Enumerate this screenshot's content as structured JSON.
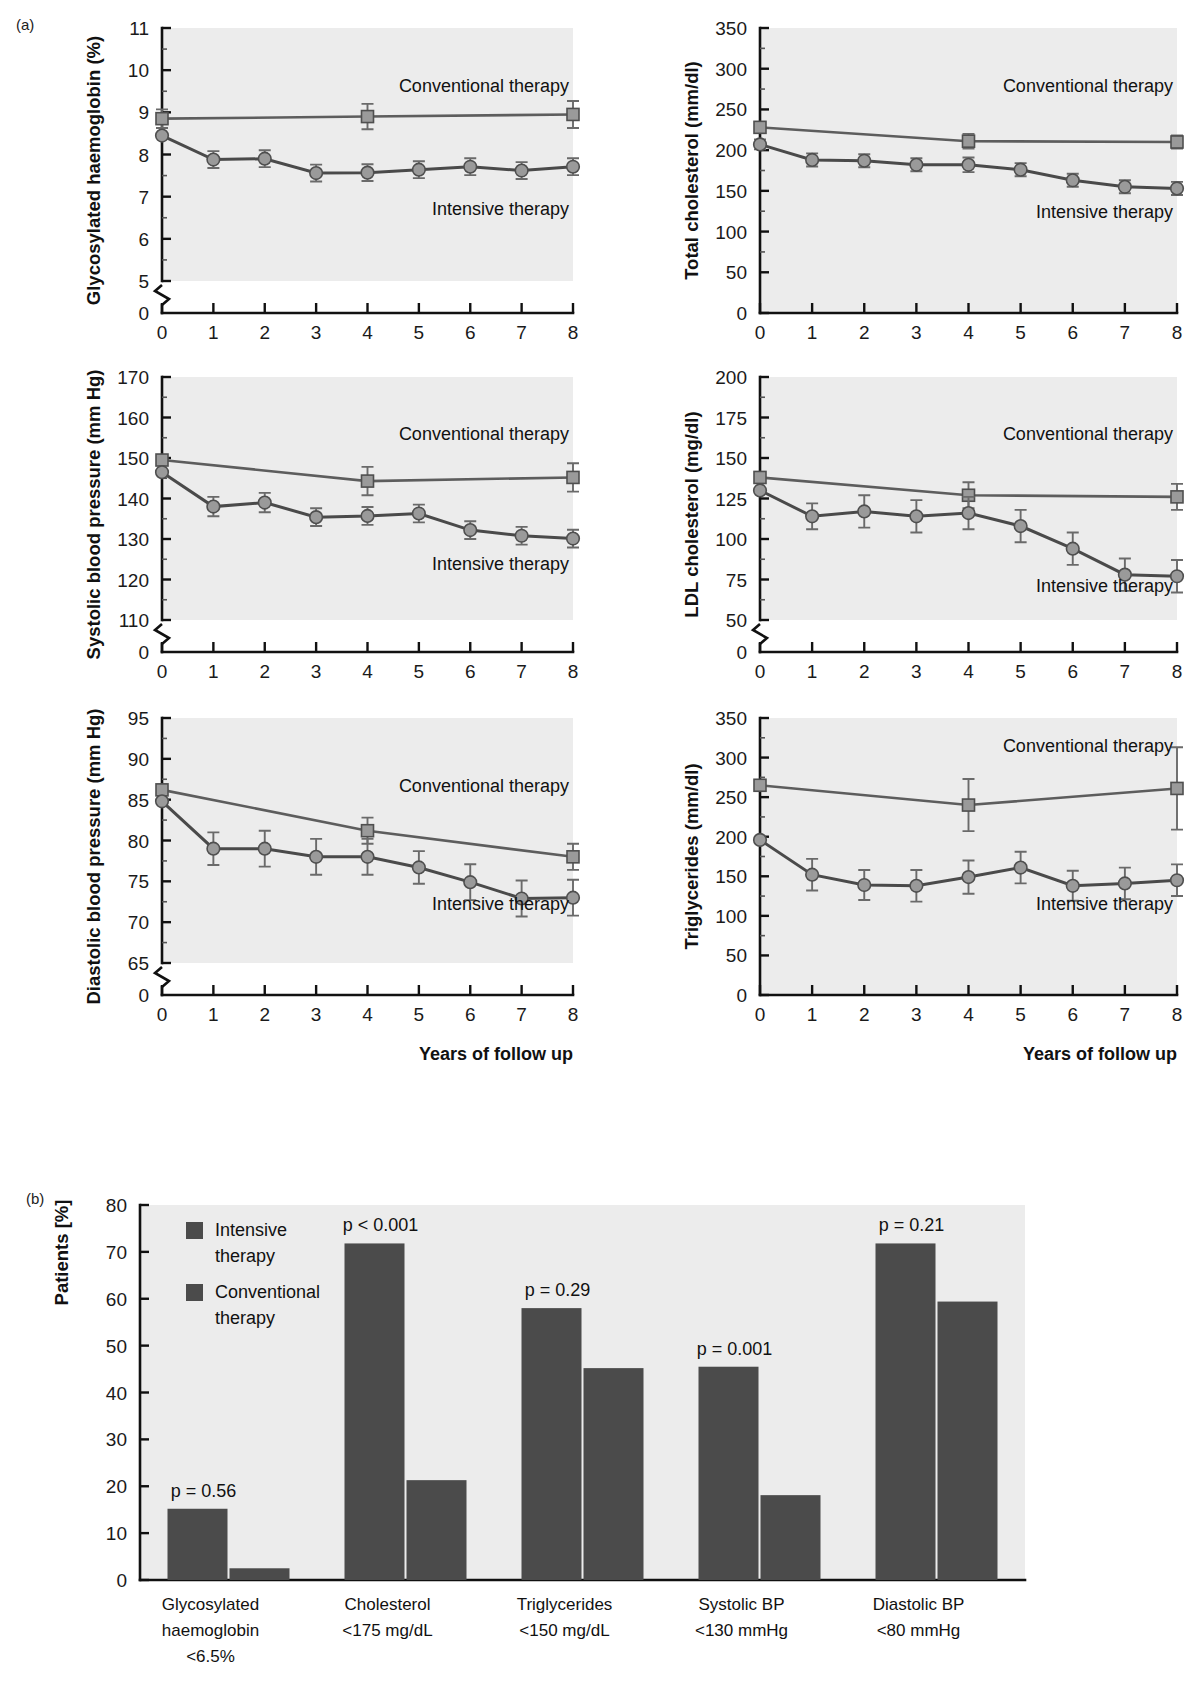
{
  "panels": {
    "a_label": "(a)",
    "b_label": "(b)"
  },
  "common": {
    "xaxis_caption": "Years of follow up",
    "series_conventional": "Conventional therapy",
    "series_intensive": "Intensive therapy",
    "x_ticks": [
      "0",
      "1",
      "2",
      "3",
      "4",
      "5",
      "6",
      "7",
      "8"
    ]
  },
  "chart_data": [
    {
      "id": "hba1c",
      "type": "line",
      "title": "",
      "ylabel": "Glycosylated haemoglobin (%)",
      "xlabel": "Years of follow up",
      "x": [
        0,
        1,
        2,
        3,
        4,
        5,
        6,
        7,
        8
      ],
      "ytick_labels": [
        "0",
        "5",
        "6",
        "7",
        "8",
        "9",
        "10",
        "11"
      ],
      "ytick_values": [
        0,
        5,
        6,
        7,
        8,
        9,
        10,
        11
      ],
      "ylim": [
        5,
        11
      ],
      "axis_break": true,
      "grid": false,
      "legend_position": "inline-right",
      "series": [
        {
          "name": "Conventional therapy",
          "marker": "square",
          "x": [
            0,
            4,
            8
          ],
          "values": [
            8.85,
            8.9,
            8.95
          ],
          "errors": [
            0.22,
            0.3,
            0.32
          ]
        },
        {
          "name": "Intensive therapy",
          "marker": "circle",
          "x": [
            0,
            1,
            2,
            3,
            4,
            5,
            6,
            7,
            8
          ],
          "values": [
            8.45,
            7.88,
            7.9,
            7.56,
            7.57,
            7.64,
            7.71,
            7.62,
            7.71
          ],
          "errors": [
            0.0,
            0.2,
            0.2,
            0.2,
            0.2,
            0.2,
            0.2,
            0.2,
            0.2
          ]
        }
      ]
    },
    {
      "id": "total-cholesterol",
      "type": "line",
      "title": "",
      "ylabel": "Total cholesterol (mm/dl)",
      "xlabel": "Years of follow up",
      "x": [
        0,
        1,
        2,
        3,
        4,
        5,
        6,
        7,
        8
      ],
      "ytick_labels": [
        "0",
        "50",
        "100",
        "150",
        "200",
        "250",
        "300",
        "350"
      ],
      "ytick_values": [
        0,
        50,
        100,
        150,
        200,
        250,
        300,
        350
      ],
      "ylim": [
        0,
        350
      ],
      "axis_break": false,
      "grid": false,
      "legend_position": "inline-right",
      "series": [
        {
          "name": "Conventional therapy",
          "marker": "square",
          "x": [
            0,
            4,
            8
          ],
          "values": [
            228,
            211,
            210
          ],
          "errors": [
            0.0,
            9,
            8
          ]
        },
        {
          "name": "Intensive therapy",
          "marker": "circle",
          "x": [
            0,
            1,
            2,
            3,
            4,
            5,
            6,
            7,
            8
          ],
          "values": [
            207,
            188,
            187,
            182,
            182,
            176,
            163,
            155,
            153
          ],
          "errors": [
            6,
            8,
            8,
            8,
            9,
            8,
            8,
            8,
            8
          ]
        }
      ]
    },
    {
      "id": "systolic-bp",
      "type": "line",
      "title": "",
      "ylabel": "Systolic blood pressure (mm Hg)",
      "xlabel": "Years of follow up",
      "x": [
        0,
        1,
        2,
        3,
        4,
        5,
        6,
        7,
        8
      ],
      "ytick_labels": [
        "0",
        "110",
        "120",
        "130",
        "140",
        "150",
        "160",
        "170"
      ],
      "ytick_values": [
        0,
        110,
        120,
        130,
        140,
        150,
        160,
        170
      ],
      "ylim": [
        110,
        170
      ],
      "axis_break": true,
      "grid": false,
      "legend_position": "inline-right",
      "series": [
        {
          "name": "Conventional therapy",
          "marker": "square",
          "x": [
            0,
            4,
            8
          ],
          "values": [
            149.5,
            144.3,
            145.2
          ],
          "errors": [
            0.0,
            3.5,
            3.5
          ]
        },
        {
          "name": "Intensive therapy",
          "marker": "circle",
          "x": [
            0,
            1,
            2,
            3,
            4,
            5,
            6,
            7,
            8
          ],
          "values": [
            146.5,
            138.0,
            139.0,
            135.4,
            135.7,
            136.3,
            132.2,
            130.8,
            130.1
          ],
          "errors": [
            0.0,
            2.4,
            2.4,
            2.2,
            2.2,
            2.2,
            2.2,
            2.2,
            2.2
          ]
        }
      ]
    },
    {
      "id": "ldl-cholesterol",
      "type": "line",
      "title": "",
      "ylabel": "LDL cholesterol (mg/dl)",
      "xlabel": "Years of follow up",
      "x": [
        0,
        1,
        2,
        3,
        4,
        5,
        6,
        7,
        8
      ],
      "ytick_labels": [
        "0",
        "50",
        "75",
        "100",
        "125",
        "150",
        "175",
        "200"
      ],
      "ytick_values": [
        0,
        50,
        75,
        100,
        125,
        150,
        175,
        200
      ],
      "ylim": [
        50,
        200
      ],
      "axis_break": true,
      "grid": false,
      "legend_position": "inline-right",
      "series": [
        {
          "name": "Conventional therapy",
          "marker": "square",
          "x": [
            0,
            4,
            8
          ],
          "values": [
            138,
            127,
            126
          ],
          "errors": [
            0.0,
            8,
            8
          ]
        },
        {
          "name": "Intensive therapy",
          "marker": "circle",
          "x": [
            0,
            1,
            2,
            3,
            4,
            5,
            6,
            7,
            8
          ],
          "values": [
            130,
            114,
            117,
            114,
            116,
            108,
            94,
            78,
            77
          ],
          "errors": [
            0.0,
            8,
            10,
            10,
            10,
            10,
            10,
            10,
            10
          ]
        }
      ]
    },
    {
      "id": "diastolic-bp",
      "type": "line",
      "title": "",
      "ylabel": "Diastolic blood pressure (mm Hg)",
      "xlabel": "Years of follow up",
      "x": [
        0,
        1,
        2,
        3,
        4,
        5,
        6,
        7,
        8
      ],
      "ytick_labels": [
        "0",
        "65",
        "70",
        "75",
        "80",
        "85",
        "90",
        "95"
      ],
      "ytick_values": [
        0,
        65,
        70,
        75,
        80,
        85,
        90,
        95
      ],
      "ylim": [
        65,
        95
      ],
      "axis_break": true,
      "grid": false,
      "legend_position": "inline-right",
      "series": [
        {
          "name": "Conventional therapy",
          "marker": "square",
          "x": [
            0,
            4,
            8
          ],
          "values": [
            86.2,
            81.2,
            78.0
          ],
          "errors": [
            0.0,
            1.6,
            1.6
          ]
        },
        {
          "name": "Intensive therapy",
          "marker": "circle",
          "x": [
            0,
            1,
            2,
            3,
            4,
            5,
            6,
            7,
            8
          ],
          "values": [
            84.8,
            79.0,
            79.0,
            78.0,
            78.0,
            76.7,
            74.9,
            72.9,
            73.0
          ],
          "errors": [
            0.0,
            2.0,
            2.2,
            2.2,
            2.2,
            2.0,
            2.2,
            2.2,
            2.2
          ]
        }
      ]
    },
    {
      "id": "triglycerides",
      "type": "line",
      "title": "",
      "ylabel": "Triglycerides (mm/dl)",
      "xlabel": "Years of follow up",
      "x": [
        0,
        1,
        2,
        3,
        4,
        5,
        6,
        7,
        8
      ],
      "ytick_labels": [
        "0",
        "50",
        "100",
        "150",
        "200",
        "250",
        "300",
        "350"
      ],
      "ytick_values": [
        0,
        50,
        100,
        150,
        200,
        250,
        300,
        350
      ],
      "ylim": [
        0,
        350
      ],
      "axis_break": false,
      "grid": false,
      "legend_position": "inline-right",
      "series": [
        {
          "name": "Conventional therapy",
          "marker": "square",
          "x": [
            0,
            4,
            8
          ],
          "values": [
            265,
            240,
            261
          ],
          "errors": [
            0.0,
            33,
            52
          ]
        },
        {
          "name": "Intensive therapy",
          "marker": "circle",
          "x": [
            0,
            1,
            2,
            3,
            4,
            5,
            6,
            7,
            8
          ],
          "values": [
            196,
            152,
            139,
            138,
            149,
            161,
            138,
            141,
            145
          ],
          "errors": [
            0.0,
            20,
            19,
            20,
            21,
            20,
            19,
            20,
            20
          ]
        }
      ]
    },
    {
      "id": "targets-achieved",
      "type": "bar",
      "title": "",
      "ylabel": "Patients [%]",
      "xlabel": "",
      "ylim": [
        0,
        80
      ],
      "ytick_labels": [
        "0",
        "10",
        "20",
        "30",
        "40",
        "50",
        "60",
        "70",
        "80"
      ],
      "ytick_values": [
        0,
        10,
        20,
        30,
        40,
        50,
        60,
        70,
        80
      ],
      "grid": false,
      "legend_position": "top-left-inside",
      "legend": [
        "Intensive therapy",
        "Conventional therapy"
      ],
      "categories": [
        "Glycosylated haemoglobin <6.5%",
        "Cholesterol <175 mg/dL",
        "Triglycerides <150 mg/dL",
        "Systolic BP <130 mmHg",
        "Diastolic BP <80 mmHg"
      ],
      "category_lines": [
        [
          "Glycosylated",
          "haemoglobin",
          "<6.5%"
        ],
        [
          "Cholesterol",
          "<175 mg/dL"
        ],
        [
          "Triglycerides",
          "<150 mg/dL"
        ],
        [
          "Systolic BP",
          "<130 mmHg"
        ],
        [
          "Diastolic BP",
          "<80 mmHg"
        ]
      ],
      "series": [
        {
          "name": "Intensive therapy",
          "values": [
            15.2,
            71.8,
            58.0,
            45.5,
            71.8
          ]
        },
        {
          "name": "Conventional therapy",
          "values": [
            2.5,
            21.3,
            45.2,
            18.1,
            59.4
          ]
        }
      ],
      "annotations": [
        "p = 0.56",
        "p < 0.001",
        "p = 0.29",
        "p = 0.001",
        "p = 0.21"
      ]
    }
  ],
  "colors": {
    "plot_background": "#ececec",
    "axis": "#111111",
    "conventional_line": "#5d5d5d",
    "intensive_line": "#4a4a4a",
    "marker_fill": "#9a9a9a",
    "marker_stroke": "#4f4f4f",
    "bar_fill": "#4b4b4b"
  }
}
